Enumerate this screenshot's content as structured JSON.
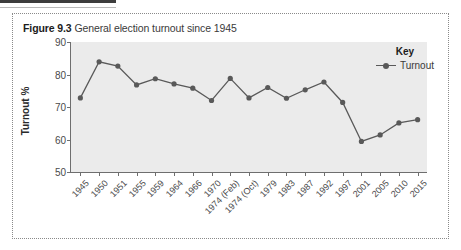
{
  "figure": {
    "number_label": "Figure 9.3",
    "caption": " General election turnout since 1945"
  },
  "legend": {
    "title": "Key",
    "series_label": "Turnout",
    "marker_icon": "line-with-dot-marker-icon"
  },
  "colors": {
    "plot_background": "#ebebeb",
    "line": "#595959",
    "marker": "#595959",
    "axis": "#6e6e6e",
    "panel_border": "#8a8a8a",
    "text": "#3a3a3a"
  },
  "chart_data": {
    "type": "line",
    "title": "General election turnout since 1945",
    "xlabel": "",
    "ylabel": "Turnout %",
    "ylim": [
      50,
      90
    ],
    "yticks": [
      50,
      60,
      70,
      80,
      90
    ],
    "grid": false,
    "legend_position": "top-right",
    "categories": [
      "1945",
      "1950",
      "1951",
      "1955",
      "1959",
      "1964",
      "1966",
      "1970",
      "1974 (Feb)",
      "1974 (Oct)",
      "1979",
      "1983",
      "1987",
      "1992",
      "1997",
      "2001",
      "2005",
      "2010",
      "2015"
    ],
    "series": [
      {
        "name": "Turnout",
        "values": [
          72.8,
          83.9,
          82.6,
          76.8,
          78.7,
          77.1,
          75.8,
          72.0,
          78.8,
          72.8,
          76.0,
          72.7,
          75.3,
          77.7,
          71.4,
          59.4,
          61.4,
          65.1,
          66.1
        ]
      }
    ]
  }
}
